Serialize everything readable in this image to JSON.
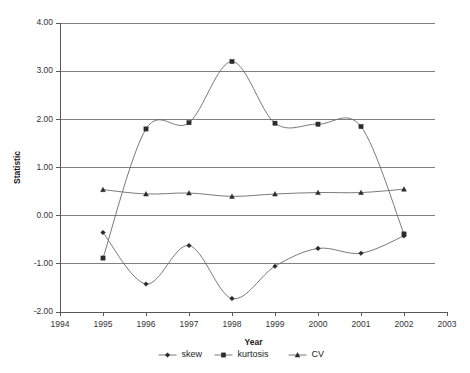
{
  "chart_data": {
    "type": "line",
    "title": "",
    "xlabel": "Year",
    "ylabel": "Statistic",
    "x": [
      1995,
      1996,
      1997,
      1998,
      1999,
      2000,
      2001,
      2002
    ],
    "categories": [
      "1995",
      "1996",
      "1997",
      "1998",
      "1999",
      "2000",
      "2001",
      "2002"
    ],
    "xlim": [
      1994,
      2003
    ],
    "ylim": [
      -2.0,
      4.0
    ],
    "xticks": [
      "1994",
      "1995",
      "1996",
      "1997",
      "1998",
      "1999",
      "2000",
      "2001",
      "2002",
      "2003"
    ],
    "yticks": [
      "-2.00",
      "-1.00",
      "0.00",
      "1.00",
      "2.00",
      "3.00",
      "4.00"
    ],
    "grid": "horizontal",
    "legend_position": "bottom",
    "series": [
      {
        "name": "skew",
        "marker": "diamond",
        "color": "#2b2b2b",
        "values": [
          -0.35,
          -1.42,
          -0.62,
          -1.72,
          -1.05,
          -0.68,
          -0.78,
          -0.42
        ]
      },
      {
        "name": "kurtosis",
        "marker": "square",
        "color": "#2b2b2b",
        "values": [
          -0.88,
          1.8,
          1.93,
          3.2,
          1.92,
          1.9,
          1.85,
          -0.38
        ]
      },
      {
        "name": "CV",
        "marker": "triangle",
        "color": "#2b2b2b",
        "values": [
          0.54,
          0.45,
          0.47,
          0.4,
          0.45,
          0.48,
          0.48,
          0.55
        ]
      }
    ]
  },
  "axes": {
    "y_title": "Statistic",
    "x_title": "Year"
  },
  "legend": {
    "items": [
      {
        "label": "skew"
      },
      {
        "label": "kurtosis"
      },
      {
        "label": "CV"
      }
    ]
  }
}
